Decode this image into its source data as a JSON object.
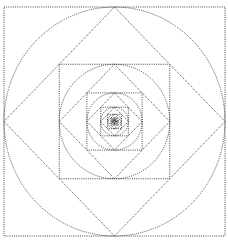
{
  "diagram": {
    "title": "",
    "style": {
      "background": "#ffffff",
      "stroke_color": "#333333",
      "line_style": "dotted"
    },
    "geometry": {
      "outer_square": {
        "x0": 4,
        "y0": 7,
        "x1": 225,
        "y1": 236
      },
      "levels": 12,
      "scale_per_level": 0.5,
      "elements_per_level": [
        "square",
        "circle",
        "diamond"
      ]
    }
  }
}
